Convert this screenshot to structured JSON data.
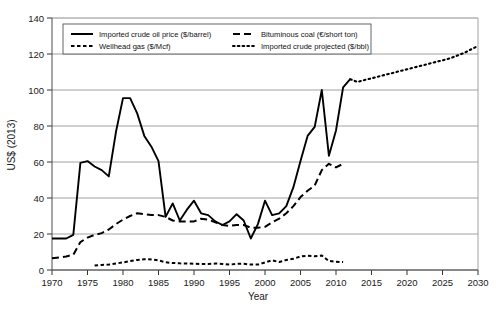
{
  "chart_data": {
    "type": "line",
    "title": "",
    "xlabel": "Year",
    "ylabel": "US$ (2013)",
    "xlim": [
      1970,
      2030
    ],
    "ylim": [
      0,
      140
    ],
    "xticks": [
      1970,
      1975,
      1980,
      1985,
      1990,
      1995,
      2000,
      2005,
      2010,
      2015,
      2020,
      2025,
      2030
    ],
    "yticks": [
      0,
      20,
      40,
      60,
      80,
      100,
      120,
      140
    ],
    "grid": "horizontal",
    "legend_position": "top-inside",
    "series": [
      {
        "name": "Imported crude oil price ($/barrel)",
        "style": "solid",
        "color": "#000000",
        "x": [
          1970,
          1971,
          1972,
          1973,
          1974,
          1975,
          1976,
          1977,
          1978,
          1979,
          1980,
          1981,
          1982,
          1983,
          1984,
          1985,
          1986,
          1987,
          1988,
          1989,
          1990,
          1991,
          1992,
          1993,
          1994,
          1995,
          1996,
          1997,
          1998,
          1999,
          2000,
          2001,
          2002,
          2003,
          2004,
          2005,
          2006,
          2007,
          2008,
          2009,
          2010,
          2011,
          2012
        ],
        "values": [
          17.5,
          17.5,
          17.5,
          19.5,
          59.5,
          60.5,
          57.5,
          55.5,
          52.0,
          76.5,
          95.5,
          95.5,
          87.0,
          74.5,
          68.5,
          60.5,
          29.5,
          37.0,
          27.5,
          33.5,
          38.5,
          31.5,
          30.5,
          27.0,
          25.0,
          27.0,
          31.0,
          27.5,
          17.5,
          25.5,
          38.5,
          30.5,
          31.5,
          35.5,
          46.0,
          60.5,
          74.5,
          79.5,
          100.0,
          63.5,
          77.5,
          101.5,
          106.0
        ]
      },
      {
        "name": "Bituminous coal (€/short ton)",
        "style": "dashed",
        "color": "#000000",
        "x": [
          1970,
          1971,
          1972,
          1973,
          1974,
          1975,
          1976,
          1977,
          1978,
          1979,
          1980,
          1981,
          1982,
          1983,
          1984,
          1985,
          1986,
          1987,
          1988,
          1989,
          1990,
          1991,
          1992,
          1993,
          1994,
          1995,
          1996,
          1997,
          1998,
          1999,
          2000,
          2001,
          2002,
          2003,
          2004,
          2005,
          2006,
          2007,
          2008,
          2009,
          2010,
          2011
        ],
        "values": [
          6.5,
          7.0,
          7.5,
          8.5,
          15.5,
          18.0,
          19.5,
          20.5,
          22.5,
          25.5,
          28.0,
          30.0,
          31.5,
          31.0,
          30.5,
          30.5,
          29.5,
          27.5,
          27.0,
          27.0,
          27.0,
          28.5,
          28.0,
          26.5,
          25.0,
          24.5,
          25.0,
          25.0,
          23.5,
          23.5,
          24.0,
          26.5,
          28.5,
          31.5,
          35.5,
          40.5,
          44.0,
          47.0,
          55.5,
          59.0,
          57.0,
          59.0
        ]
      },
      {
        "name": "Wellhead gas ($/Mcf)",
        "style": "dotted-dash",
        "color": "#000000",
        "x": [
          1976,
          1977,
          1978,
          1979,
          1980,
          1981,
          1982,
          1983,
          1984,
          1985,
          1986,
          1987,
          1988,
          1989,
          1990,
          1991,
          1992,
          1993,
          1994,
          1995,
          1996,
          1997,
          1998,
          1999,
          2000,
          2001,
          2002,
          2003,
          2004,
          2005,
          2006,
          2007,
          2008,
          2009,
          2010,
          2011
        ],
        "values": [
          2.5,
          2.8,
          3.0,
          3.6,
          4.2,
          5.0,
          5.6,
          6.0,
          5.9,
          5.3,
          4.3,
          3.9,
          3.7,
          3.6,
          3.5,
          3.3,
          3.3,
          3.6,
          3.4,
          3.0,
          3.4,
          3.5,
          3.0,
          3.0,
          4.2,
          5.4,
          4.4,
          5.6,
          6.2,
          7.5,
          7.9,
          7.6,
          8.0,
          5.0,
          4.6,
          4.4
        ]
      },
      {
        "name": "Imported crude projected ($/bbl)",
        "style": "dotted",
        "color": "#000000",
        "x": [
          2012,
          2013,
          2014,
          2015,
          2016,
          2017,
          2018,
          2019,
          2020,
          2021,
          2022,
          2023,
          2024,
          2025,
          2026,
          2027,
          2028,
          2029,
          2030
        ],
        "values": [
          106.0,
          104.5,
          105.5,
          106.5,
          107.5,
          108.5,
          109.5,
          110.5,
          111.5,
          112.5,
          113.5,
          114.5,
          115.5,
          116.5,
          117.5,
          119.0,
          120.5,
          122.5,
          124.5
        ]
      }
    ]
  },
  "legend": {
    "items": [
      {
        "label": "Imported crude oil price ($/barrel)",
        "style": "solid"
      },
      {
        "label": "Bituminous coal (€/short ton)",
        "style": "dashed"
      },
      {
        "label": "Wellhead gas ($/Mcf)",
        "style": "dotted-dash"
      },
      {
        "label": "Imported crude projected ($/bbl)",
        "style": "dotted"
      }
    ]
  }
}
